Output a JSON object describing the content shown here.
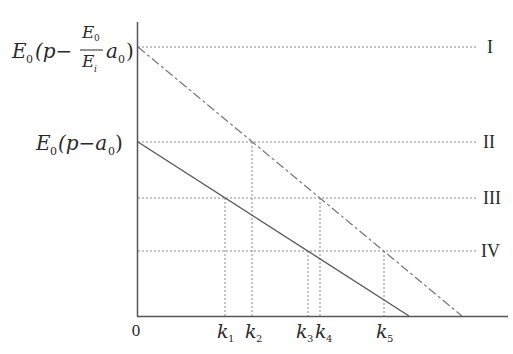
{
  "diagram": {
    "type": "line-diagram",
    "origin_label": "0",
    "y_labels": {
      "level_I": {
        "prefix_E": "E",
        "prefix_sub": "0",
        "open": "(p−",
        "frac_num_E": "E",
        "frac_num_sub": "0",
        "frac_den_E": "E",
        "frac_den_sub": "i",
        "a": "a",
        "a_sub": "0",
        "close": ")"
      },
      "level_II": {
        "E": "E",
        "E_sub": "0",
        "body": "(p−a",
        "a_sub": "0",
        "close": ")"
      }
    },
    "right_labels": [
      "I",
      "II",
      "III",
      "IV"
    ],
    "k_labels": [
      {
        "k": "k",
        "sub": "1"
      },
      {
        "k": "k",
        "sub": "2"
      },
      {
        "k": "k",
        "sub": "3"
      },
      {
        "k": "k",
        "sub": "4"
      },
      {
        "k": "k",
        "sub": "5"
      }
    ],
    "lines": [
      {
        "name": "solid-line",
        "style": "solid",
        "from_level": "II"
      },
      {
        "name": "dash-dot-line",
        "style": "dash-dot",
        "from_level": "I"
      }
    ],
    "colors": {
      "axis": "#555555",
      "line": "#555555",
      "guide": "#888888",
      "text": "#2a2a2a"
    }
  }
}
